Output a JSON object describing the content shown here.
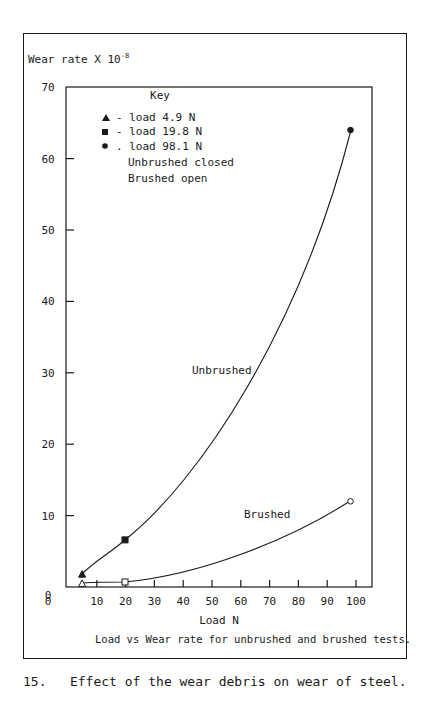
{
  "figure": {
    "number": "15.",
    "caption": "Effect of the wear debris on wear of steel."
  },
  "chart_data": {
    "type": "line",
    "title": "Load vs Wear rate for unbrushed and brushed tests.",
    "xlabel": "Load N",
    "ylabel": "Wear rate X 10",
    "ylabel_exponent": "-8",
    "xlim": [
      0,
      100
    ],
    "ylim": [
      0,
      70
    ],
    "xticks": [
      0,
      10,
      20,
      30,
      40,
      50,
      60,
      70,
      80,
      90,
      100
    ],
    "yticks": [
      0,
      10,
      20,
      30,
      40,
      50,
      60,
      70
    ],
    "grid": false,
    "legend": {
      "title": "Key",
      "position": "upper-left",
      "entries": [
        {
          "marker": "triangle",
          "label": "- load 4.9 N"
        },
        {
          "marker": "square",
          "label": "- load 19.8 N"
        },
        {
          "marker": "circle",
          "label": ". load 98.1 N"
        },
        {
          "marker": "",
          "label": "Unbrushed closed"
        },
        {
          "marker": "",
          "label": "Brushed open"
        }
      ]
    },
    "series": [
      {
        "name": "Unbrushed",
        "marker_fill": "closed",
        "x": [
          4.9,
          19.8,
          98.1
        ],
        "y": [
          1.8,
          6.6,
          64.0
        ]
      },
      {
        "name": "Brushed",
        "marker_fill": "open",
        "x": [
          4.9,
          19.8,
          98.1
        ],
        "y": [
          0.5,
          0.7,
          12.0
        ]
      }
    ],
    "annotations": [
      {
        "text": "Unbrushed",
        "x": 42,
        "y": 30
      },
      {
        "text": "Brushed",
        "x": 65,
        "y": 10.5
      }
    ]
  }
}
